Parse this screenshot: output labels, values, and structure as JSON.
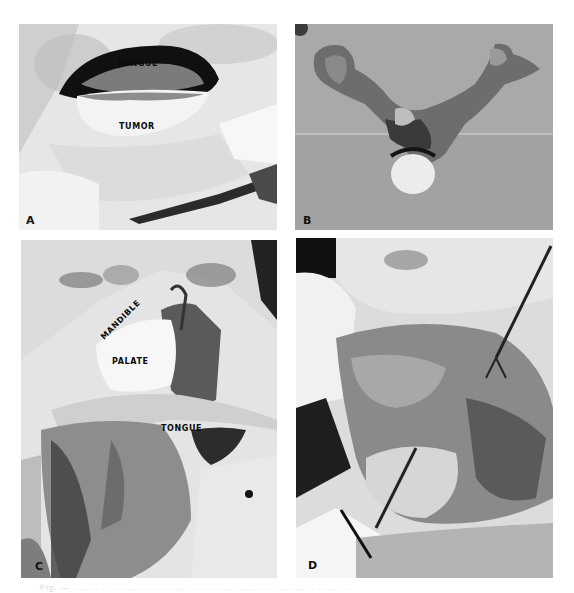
{
  "figure": {
    "panels": [
      {
        "id": "A",
        "label": "A",
        "annotations": [
          "TONGUE",
          "TUMOR"
        ]
      },
      {
        "id": "B",
        "label": "B",
        "annotations": []
      },
      {
        "id": "C",
        "label": "C",
        "annotations": [
          "MANDIBLE",
          "PALATE",
          "TONGUE"
        ]
      },
      {
        "id": "D",
        "label": "D",
        "annotations": []
      }
    ],
    "caption": "Fig. — ........ . ... ......... .. ........ .. ... ...... ........ .. ......... .. ...... ..."
  }
}
